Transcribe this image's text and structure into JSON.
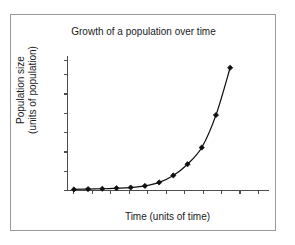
{
  "figure": {
    "border_color": "#9a9a9a",
    "background": "#ffffff"
  },
  "chart_data": {
    "type": "line",
    "title": "Growth of a population over time",
    "xlabel": "Time (units of time)",
    "ylabel_line1": "Population size",
    "ylabel_line2": "(units of population)",
    "series": [
      {
        "name": "population",
        "marker": "diamond",
        "color": "#101010",
        "x": [
          0,
          1,
          2,
          3,
          4,
          5,
          6,
          7,
          8,
          9,
          10,
          11
        ],
        "y": [
          0.6,
          0.8,
          1.0,
          1.3,
          1.7,
          2.6,
          4.6,
          8.6,
          15.0,
          24.5,
          43.0,
          70.0
        ]
      }
    ],
    "xlim": [
      -0.45,
      13.7
    ],
    "ylim": [
      0,
      77
    ],
    "xticks": [
      0,
      1.3,
      2.6,
      3.9,
      5.2,
      6.5,
      7.8,
      9.1,
      10.4,
      11.7,
      13.0
    ],
    "yticks": [
      0,
      11,
      22,
      33,
      44,
      55,
      66,
      74
    ],
    "xticklabels": [],
    "yticklabels": [],
    "grid": false,
    "legend": false,
    "axis_color": "#4d4d4d"
  }
}
